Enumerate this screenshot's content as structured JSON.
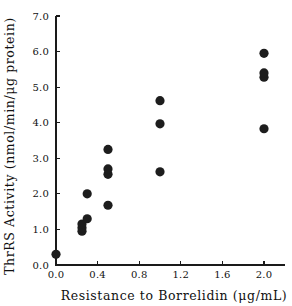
{
  "chart_data": {
    "type": "scatter",
    "title": "",
    "xlabel": "Resistance to Borrelidin  (μg/mL)",
    "ylabel": "ThrRS Activity (nmol/min/μg protein)",
    "xlim": [
      0.0,
      2.2
    ],
    "ylim": [
      0.0,
      7.0
    ],
    "grid": false,
    "legend": null,
    "xticks": [
      "0.0",
      "0.4",
      "0.8",
      "1.2",
      "1.6",
      "2.0"
    ],
    "xtick_values": [
      0.0,
      0.4,
      0.8,
      1.2,
      1.6,
      2.0
    ],
    "yticks": [
      "0.0",
      "1.0",
      "2.0",
      "3.0",
      "4.0",
      "5.0",
      "6.0",
      "7.0"
    ],
    "ytick_values": [
      0.0,
      1.0,
      2.0,
      3.0,
      4.0,
      5.0,
      6.0,
      7.0
    ],
    "marker": "filled-circle",
    "marker_color": "#1d1d1d",
    "marker_size": 4.6,
    "points": [
      {
        "x": 0.0,
        "y": 0.3
      },
      {
        "x": 0.25,
        "y": 0.95
      },
      {
        "x": 0.25,
        "y": 1.05
      },
      {
        "x": 0.25,
        "y": 1.15
      },
      {
        "x": 0.3,
        "y": 1.3
      },
      {
        "x": 0.3,
        "y": 2.0
      },
      {
        "x": 0.5,
        "y": 1.68
      },
      {
        "x": 0.5,
        "y": 2.55
      },
      {
        "x": 0.5,
        "y": 2.7
      },
      {
        "x": 0.5,
        "y": 3.25
      },
      {
        "x": 1.0,
        "y": 2.62
      },
      {
        "x": 1.0,
        "y": 3.97
      },
      {
        "x": 1.0,
        "y": 4.62
      },
      {
        "x": 2.0,
        "y": 3.83
      },
      {
        "x": 2.0,
        "y": 5.28
      },
      {
        "x": 2.0,
        "y": 5.4
      },
      {
        "x": 2.0,
        "y": 5.95
      }
    ]
  },
  "axes": {
    "x_axis_name": "x-axis",
    "y_axis_name": "y-axis"
  }
}
